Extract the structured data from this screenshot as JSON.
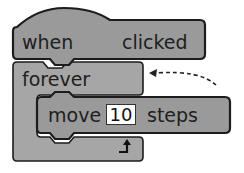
{
  "blocks": {
    "hat": {
      "word1": "when",
      "icon": "green-flag-icon",
      "word2": "clicked"
    },
    "loop": {
      "label": "forever",
      "icon": "loop-arrow-icon"
    },
    "motion": {
      "word1": "move",
      "value": "10",
      "word2": "steps"
    }
  },
  "annotation": {
    "icon": "dashed-curved-arrow-icon"
  },
  "colors": {
    "block_fill": "#9a9a9a",
    "forever_fill": "#a6a6a6",
    "outline": "#1c1c1c",
    "text": "#1e1e1e",
    "input_fill": "#ffffff"
  }
}
